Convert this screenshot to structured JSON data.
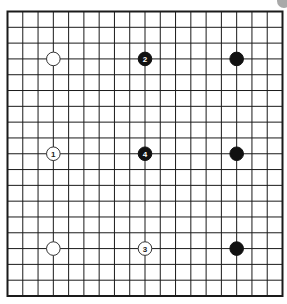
{
  "board": {
    "size": 19,
    "origin_x": 7.5,
    "origin_y": 11.5,
    "end_x": 282.5,
    "end_y": 296,
    "line_color": "#1a1a1a",
    "border_width": 2,
    "line_width": 1,
    "background": "#ffffff"
  },
  "stones": [
    {
      "col": 3,
      "row": 3,
      "color": "white",
      "label": ""
    },
    {
      "col": 9,
      "row": 3,
      "color": "black",
      "label": "2"
    },
    {
      "col": 15,
      "row": 3,
      "color": "black",
      "label": ""
    },
    {
      "col": 3,
      "row": 9,
      "color": "white",
      "label": "1"
    },
    {
      "col": 9,
      "row": 9,
      "color": "black",
      "label": "4"
    },
    {
      "col": 15,
      "row": 9,
      "color": "black",
      "label": ""
    },
    {
      "col": 3,
      "row": 15,
      "color": "white",
      "label": ""
    },
    {
      "col": 9,
      "row": 15,
      "color": "white",
      "label": "3"
    },
    {
      "col": 15,
      "row": 15,
      "color": "black",
      "label": ""
    }
  ],
  "colors": {
    "black_stone": "#111111",
    "white_stone": "#ffffff",
    "white_stone_outline": "#333333",
    "black_label": "#ffffff",
    "white_label": "#222222",
    "corner_badge": "#a9a9a9"
  },
  "stone_radius": 6.8
}
